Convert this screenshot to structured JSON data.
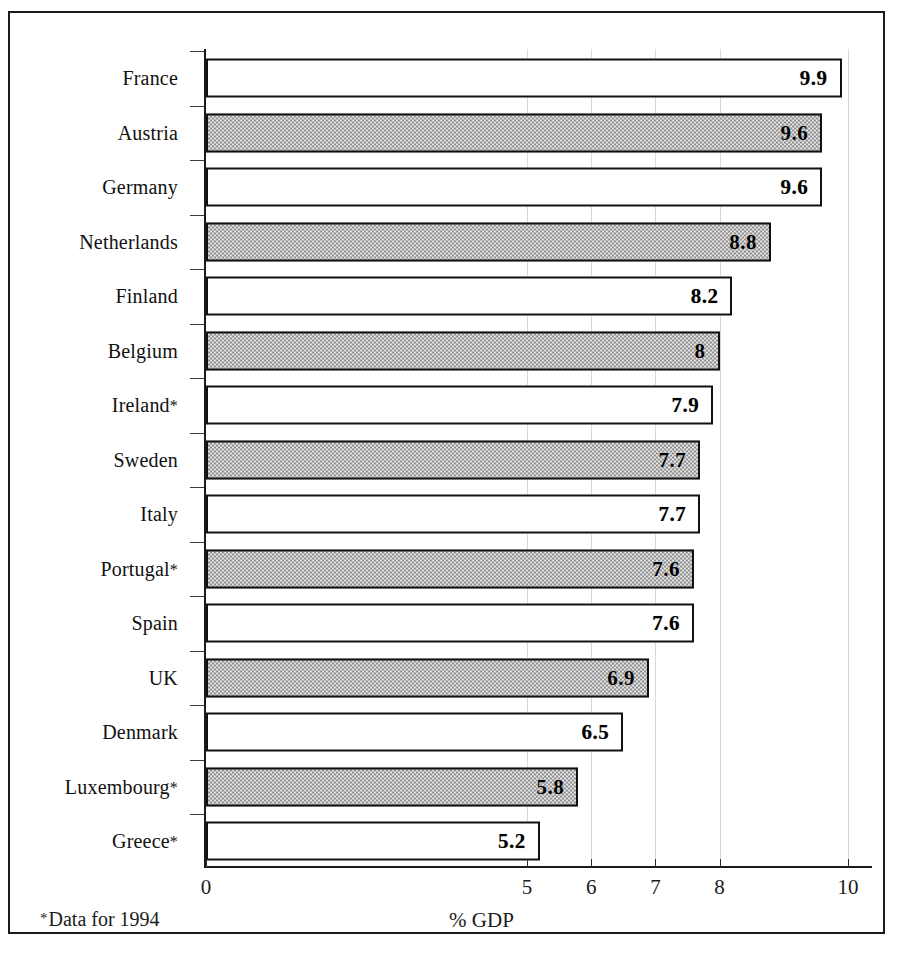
{
  "chart_data": {
    "type": "bar",
    "orientation": "horizontal",
    "title": "",
    "xlabel": "% GDP",
    "ylabel": "",
    "categories": [
      "France",
      "Austria",
      "Germany",
      "Netherlands",
      "Finland",
      "Belgium",
      "Ireland*",
      "Sweden",
      "Italy",
      "Portugal*",
      "Spain",
      "UK",
      "Denmark",
      "Luxembourg*",
      "Greece*"
    ],
    "values": [
      9.9,
      9.6,
      9.6,
      8.8,
      8.2,
      8,
      7.9,
      7.7,
      7.7,
      7.6,
      7.6,
      6.9,
      6.5,
      5.8,
      5.2
    ],
    "value_labels": [
      "9.9",
      "9.6",
      "9.6",
      "8.8",
      "8.2",
      "8",
      "7.9",
      "7.7",
      "7.7",
      "7.6",
      "7.6",
      "6.9",
      "6.5",
      "5.8",
      "5.2"
    ],
    "bar_styles": [
      "white",
      "hatched",
      "white",
      "hatched",
      "white",
      "hatched",
      "white",
      "hatched",
      "white",
      "hatched",
      "white",
      "hatched",
      "white",
      "hatched",
      "white"
    ],
    "xlim": [
      0,
      10.45
    ],
    "xticks": [
      0,
      5,
      6,
      7,
      8,
      10
    ],
    "xtick_labels": [
      "0",
      "5",
      "6",
      "7",
      "8",
      "10"
    ],
    "xtick_positions": [
      0,
      5,
      6,
      7,
      8,
      10
    ],
    "grid": true,
    "grid_axis": "x",
    "legend": "none",
    "footnote": "Data for 1994",
    "footnote_marker": "*",
    "colors": {
      "bar_white": "#ffffff",
      "bar_hatched": "#b9b9b9",
      "bar_border": "#111111",
      "axis": "#1a1a1a",
      "grid": "#d8d8d8",
      "text": "#111111"
    }
  }
}
